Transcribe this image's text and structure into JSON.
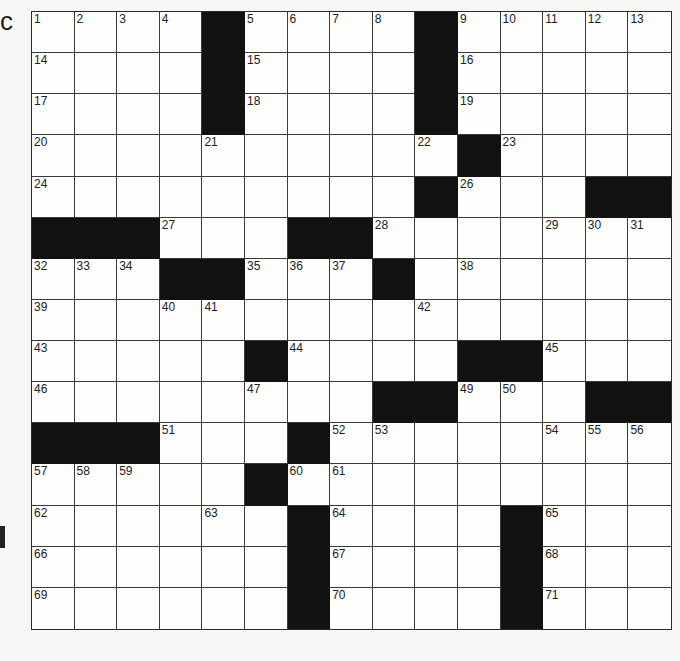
{
  "puzzle": {
    "rows": 15,
    "cols": 15,
    "edge_fragments": {
      "top_left": "c",
      "left_mid": "|"
    },
    "colors": {
      "block": "#111111",
      "cell": "#fdfdfb",
      "line": "#3a3a3a",
      "background": "#f7f7f5"
    },
    "pattern": [
      "....#....#.....",
      "....#....#.....",
      "....#....#.....",
      "..........#....",
      ".........#...###",
      "###...##......",
      "...##...#......",
      "...............",
      ".....#....##...",
      "........##...###",
      "###...#........",
      ".....#.........",
      "......#....#...",
      "......#....#...",
      "......#....#..."
    ],
    "numbers": [
      {
        "r": 0,
        "c": 0,
        "n": "1"
      },
      {
        "r": 0,
        "c": 1,
        "n": "2"
      },
      {
        "r": 0,
        "c": 2,
        "n": "3"
      },
      {
        "r": 0,
        "c": 3,
        "n": "4"
      },
      {
        "r": 0,
        "c": 5,
        "n": "5"
      },
      {
        "r": 0,
        "c": 6,
        "n": "6"
      },
      {
        "r": 0,
        "c": 7,
        "n": "7"
      },
      {
        "r": 0,
        "c": 8,
        "n": "8"
      },
      {
        "r": 0,
        "c": 10,
        "n": "9"
      },
      {
        "r": 0,
        "c": 11,
        "n": "10"
      },
      {
        "r": 0,
        "c": 12,
        "n": "11"
      },
      {
        "r": 0,
        "c": 13,
        "n": "12"
      },
      {
        "r": 0,
        "c": 14,
        "n": "13"
      },
      {
        "r": 1,
        "c": 0,
        "n": "14"
      },
      {
        "r": 1,
        "c": 5,
        "n": "15"
      },
      {
        "r": 1,
        "c": 10,
        "n": "16"
      },
      {
        "r": 2,
        "c": 0,
        "n": "17"
      },
      {
        "r": 2,
        "c": 5,
        "n": "18"
      },
      {
        "r": 2,
        "c": 10,
        "n": "19"
      },
      {
        "r": 3,
        "c": 0,
        "n": "20"
      },
      {
        "r": 3,
        "c": 4,
        "n": "21"
      },
      {
        "r": 3,
        "c": 9,
        "n": "22"
      },
      {
        "r": 3,
        "c": 11,
        "n": "23"
      },
      {
        "r": 4,
        "c": 0,
        "n": "24"
      },
      {
        "r": 4,
        "c": 9,
        "n": "25"
      },
      {
        "r": 4,
        "c": 10,
        "n": "26"
      },
      {
        "r": 5,
        "c": 3,
        "n": "27"
      },
      {
        "r": 5,
        "c": 8,
        "n": "28"
      },
      {
        "r": 5,
        "c": 12,
        "n": "29"
      },
      {
        "r": 5,
        "c": 13,
        "n": "30"
      },
      {
        "r": 5,
        "c": 14,
        "n": "31"
      },
      {
        "r": 6,
        "c": 0,
        "n": "32"
      },
      {
        "r": 6,
        "c": 1,
        "n": "33"
      },
      {
        "r": 6,
        "c": 2,
        "n": "34"
      },
      {
        "r": 6,
        "c": 5,
        "n": "35"
      },
      {
        "r": 6,
        "c": 6,
        "n": "36"
      },
      {
        "r": 6,
        "c": 7,
        "n": "37"
      },
      {
        "r": 6,
        "c": 10,
        "n": "38"
      },
      {
        "r": 7,
        "c": 0,
        "n": "39"
      },
      {
        "r": 7,
        "c": 3,
        "n": "40"
      },
      {
        "r": 7,
        "c": 4,
        "n": "41"
      },
      {
        "r": 7,
        "c": 9,
        "n": "42"
      },
      {
        "r": 8,
        "c": 0,
        "n": "43"
      },
      {
        "r": 8,
        "c": 6,
        "n": "44"
      },
      {
        "r": 8,
        "c": 12,
        "n": "45"
      },
      {
        "r": 9,
        "c": 0,
        "n": "46"
      },
      {
        "r": 9,
        "c": 5,
        "n": "47"
      },
      {
        "r": 9,
        "c": 9,
        "n": "48"
      },
      {
        "r": 9,
        "c": 10,
        "n": "49"
      },
      {
        "r": 9,
        "c": 11,
        "n": "50"
      },
      {
        "r": 10,
        "c": 3,
        "n": "51"
      },
      {
        "r": 10,
        "c": 7,
        "n": "52"
      },
      {
        "r": 10,
        "c": 8,
        "n": "53"
      },
      {
        "r": 10,
        "c": 12,
        "n": "54"
      },
      {
        "r": 10,
        "c": 13,
        "n": "55"
      },
      {
        "r": 10,
        "c": 14,
        "n": "56"
      },
      {
        "r": 11,
        "c": 0,
        "n": "57"
      },
      {
        "r": 11,
        "c": 1,
        "n": "58"
      },
      {
        "r": 11,
        "c": 2,
        "n": "59"
      },
      {
        "r": 11,
        "c": 6,
        "n": "60"
      },
      {
        "r": 11,
        "c": 7,
        "n": "61"
      },
      {
        "r": 12,
        "c": 0,
        "n": "62"
      },
      {
        "r": 12,
        "c": 4,
        "n": "63"
      },
      {
        "r": 12,
        "c": 7,
        "n": "64"
      },
      {
        "r": 12,
        "c": 12,
        "n": "65"
      },
      {
        "r": 13,
        "c": 0,
        "n": "66"
      },
      {
        "r": 13,
        "c": 7,
        "n": "67"
      },
      {
        "r": 13,
        "c": 12,
        "n": "68"
      },
      {
        "r": 14,
        "c": 0,
        "n": "69"
      },
      {
        "r": 14,
        "c": 7,
        "n": "70"
      },
      {
        "r": 14,
        "c": 12,
        "n": "71"
      }
    ]
  }
}
